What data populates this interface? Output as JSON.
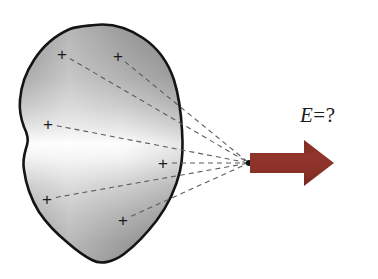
{
  "figure": {
    "type": "physics-diagram",
    "canvas": {
      "width": 378,
      "height": 279,
      "background": "#ffffff"
    },
    "label": {
      "name": "field-label",
      "text": "E = ?",
      "symbol": "E",
      "equals": "=",
      "question": "?",
      "x": 300,
      "y": 103,
      "color": "#1c1c1c",
      "style": "italic-serif"
    },
    "body": {
      "name": "charged-blob",
      "outline_color": "#141414",
      "outline_width": 2.6,
      "fill_gradient": {
        "type": "linear",
        "direction": "vertical",
        "stops": [
          {
            "offset": "0%",
            "color": "#8f8f8f"
          },
          {
            "offset": "22%",
            "color": "#a9a9a9"
          },
          {
            "offset": "42%",
            "color": "#d8d8d8"
          },
          {
            "offset": "50%",
            "color": "#fcfcfc"
          },
          {
            "offset": "58%",
            "color": "#ededed"
          },
          {
            "offset": "78%",
            "color": "#b2b2b2"
          },
          {
            "offset": "100%",
            "color": "#8a8a8a"
          }
        ]
      }
    },
    "charges": [
      {
        "name": "charge-1",
        "glyph": "+",
        "x": 62,
        "y": 54
      },
      {
        "name": "charge-2",
        "glyph": "+",
        "x": 118,
        "y": 56
      },
      {
        "name": "charge-3",
        "glyph": "+",
        "x": 48,
        "y": 124
      },
      {
        "name": "charge-4",
        "glyph": "+",
        "x": 163,
        "y": 163
      },
      {
        "name": "charge-5",
        "glyph": "+",
        "x": 47,
        "y": 199
      },
      {
        "name": "charge-6",
        "glyph": "+",
        "x": 123,
        "y": 220
      }
    ],
    "field_point": {
      "name": "field-point",
      "x": 249,
      "y": 163,
      "color": "#121212",
      "radius": 3
    },
    "dashed_lines": {
      "name": "charge-to-point-lines",
      "color": "#5c5c5c",
      "width": 1.1,
      "dash": "5 4",
      "count": 6
    },
    "arrow": {
      "name": "field-vector-arrow",
      "color": "#8d3127",
      "direction": "right",
      "tail_x": 250,
      "tip_x": 334,
      "center_y": 163,
      "shaft_height": 20,
      "head_height": 46,
      "head_length": 30
    }
  }
}
